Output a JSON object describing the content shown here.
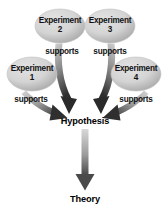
{
  "diagram": {
    "type": "flow-diagram",
    "colors": {
      "background": "#ffffff",
      "ellipse_fill_light": "#d9d9d9",
      "ellipse_fill_dark": "#a8a8a8",
      "ellipse_stroke": "#bdbdbd",
      "arrow_dark": "#3a3a3a",
      "arrow_light": "#c9c9c9",
      "text": "#111111"
    },
    "nodes": [
      {
        "id": "experiment-2",
        "name": "Experiment 2",
        "line1": "Experiment",
        "line2": "2",
        "shape": "ellipse",
        "cx": 60,
        "cy": 26,
        "rx": 25,
        "ry": 17
      },
      {
        "id": "experiment-3",
        "name": "Experiment 3",
        "line1": "Experiment",
        "line2": "3",
        "shape": "ellipse",
        "cx": 110,
        "cy": 26,
        "rx": 25,
        "ry": 17
      },
      {
        "id": "experiment-1",
        "name": "Experiment 1",
        "line1": "Experiment",
        "line2": "1",
        "shape": "ellipse",
        "cx": 32,
        "cy": 74,
        "rx": 25,
        "ry": 17
      },
      {
        "id": "experiment-4",
        "name": "Experiment 4",
        "line1": "Experiment",
        "line2": "4",
        "shape": "ellipse",
        "cx": 136,
        "cy": 74,
        "rx": 25,
        "ry": 17
      },
      {
        "id": "hypothesis",
        "name": "Hypothesis",
        "label": "Hypothesis",
        "shape": "text",
        "cx": 85,
        "cy": 122
      },
      {
        "id": "theory",
        "name": "Theory",
        "label": "Theory",
        "shape": "text",
        "cx": 85,
        "cy": 200
      }
    ],
    "edges": [
      {
        "id": "edge-exp2-hypothesis",
        "from": "experiment-2",
        "to": "hypothesis",
        "label": "supports",
        "label_x": 62,
        "label_y": 51
      },
      {
        "id": "edge-exp3-hypothesis",
        "from": "experiment-3",
        "to": "hypothesis",
        "label": "supports",
        "label_x": 110,
        "label_y": 51
      },
      {
        "id": "edge-exp1-hypothesis",
        "from": "experiment-1",
        "to": "hypothesis",
        "label": "supports",
        "label_x": 31,
        "label_y": 99
      },
      {
        "id": "edge-exp4-hypothesis",
        "from": "experiment-4",
        "to": "hypothesis",
        "label": "supports",
        "label_x": 136,
        "label_y": 99
      },
      {
        "id": "edge-hypothesis-theory",
        "from": "hypothesis",
        "to": "theory",
        "label": ""
      }
    ]
  }
}
